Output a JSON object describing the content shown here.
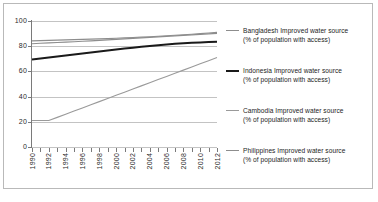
{
  "chart_data": {
    "type": "line",
    "title": "",
    "xlabel": "",
    "ylabel": "",
    "ylim": [
      0,
      100
    ],
    "xlim": [
      1990,
      2012
    ],
    "yticks": [
      0,
      20,
      40,
      60,
      80,
      100
    ],
    "ytick_labels": [
      "0",
      "20",
      "40",
      "60",
      "80",
      "100"
    ],
    "grid": true,
    "legend_position": "right",
    "x": [
      1990,
      1991,
      1992,
      1993,
      1994,
      1995,
      1996,
      1997,
      1998,
      1999,
      2000,
      2001,
      2002,
      2003,
      2004,
      2005,
      2006,
      2007,
      2008,
      2009,
      2010,
      2011,
      2012
    ],
    "xtick_labels": [
      "1990",
      "1992",
      "1994",
      "1996",
      "1998",
      "2000",
      "2002",
      "2004",
      "2006",
      "2008",
      "2010",
      "2012"
    ],
    "xtick_label_years": [
      1990,
      1992,
      1994,
      1996,
      1998,
      2000,
      2002,
      2004,
      2006,
      2008,
      2010,
      2012
    ],
    "series": [
      {
        "name": "Bangladesh Improved water source",
        "sublabel": "(% of population with access)",
        "color": "#8d8d8d",
        "width": 1.1,
        "values": [
          82.0,
          82.3,
          82.6,
          82.9,
          83.2,
          83.5,
          83.9,
          84.2,
          84.6,
          85.0,
          85.4,
          85.8,
          86.2,
          86.6,
          87.0,
          87.4,
          87.8,
          88.2,
          88.6,
          89.0,
          89.4,
          89.8,
          90.2
        ]
      },
      {
        "name": "Indonesia Improved water source",
        "sublabel": "(% of population with access)",
        "color": "#1a1a1a",
        "width": 2.0,
        "values": [
          69.5,
          70.2,
          71.0,
          71.8,
          72.6,
          73.4,
          74.2,
          75.0,
          75.8,
          76.6,
          77.4,
          78.1,
          78.8,
          79.5,
          80.2,
          80.8,
          81.4,
          81.9,
          82.3,
          82.7,
          83.0,
          83.3,
          83.5
        ]
      },
      {
        "name": "Cambodia Improved water source",
        "sublabel": "(% of population with access)",
        "color": "#9a9a9a",
        "width": 1.1,
        "values": [
          21.0,
          21.0,
          21.0,
          23.5,
          26.0,
          28.5,
          31.0,
          33.5,
          36.0,
          38.5,
          41.0,
          43.5,
          46.0,
          48.5,
          51.0,
          53.5,
          56.0,
          58.5,
          61.0,
          63.5,
          66.0,
          68.5,
          71.0
        ]
      },
      {
        "name": "Philippines Improved water source",
        "sublabel": "(% of population with access)",
        "color": "#8d8d8d",
        "width": 1.1,
        "values": [
          84.2,
          84.4,
          84.6,
          84.8,
          85.0,
          85.2,
          85.4,
          85.6,
          85.8,
          86.0,
          86.3,
          86.6,
          86.9,
          87.2,
          87.5,
          87.9,
          88.3,
          88.7,
          89.1,
          89.5,
          90.0,
          90.5,
          91.0
        ]
      }
    ]
  },
  "legend": {
    "items": [
      {
        "label": "Bangladesh Improved water source",
        "sublabel": "(% of population with access)"
      },
      {
        "label": "Indonesia Improved water source",
        "sublabel": "(% of population with access)"
      },
      {
        "label": "Cambodia Improved water source",
        "sublabel": "(% of population with access)"
      },
      {
        "label": "Philippines Improved water source",
        "sublabel": "(% of population with access)"
      }
    ]
  },
  "caption": {
    "text": ""
  }
}
